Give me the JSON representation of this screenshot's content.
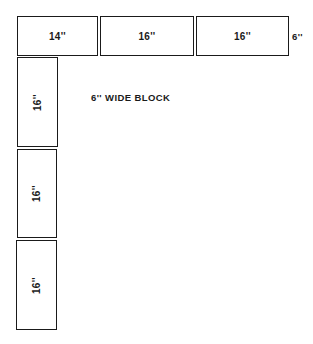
{
  "diagram": {
    "title_label": "6'' WIDE BLOCK",
    "height_label": "6''",
    "horizontal_row": [
      {
        "length": "14''"
      },
      {
        "length": "16''"
      },
      {
        "length": "16''"
      }
    ],
    "vertical_column": [
      {
        "length": "16''"
      },
      {
        "length": "16''"
      },
      {
        "length": "16''"
      }
    ]
  }
}
